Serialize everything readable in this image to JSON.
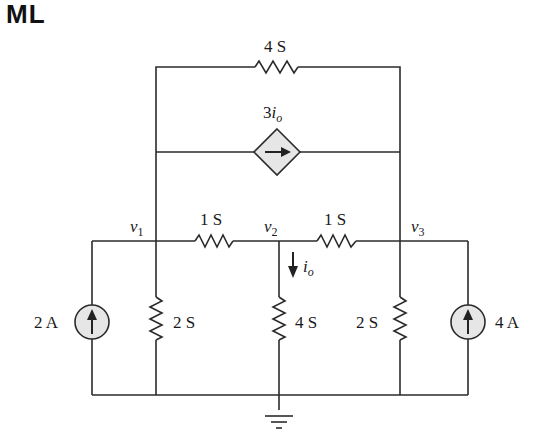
{
  "header": {
    "corner_text": "ML"
  },
  "circuit": {
    "top_resistor": {
      "value": "4 S"
    },
    "dependent_source": {
      "coef": "3",
      "var": "i",
      "sub": "o",
      "type": "current-controlled current source"
    },
    "nodes": [
      {
        "name": "v",
        "sub": "1"
      },
      {
        "name": "v",
        "sub": "2"
      },
      {
        "name": "v",
        "sub": "3"
      }
    ],
    "series_resistors": [
      {
        "value": "1 S"
      },
      {
        "value": "1 S"
      }
    ],
    "shunt_resistors": [
      {
        "value": "2 S"
      },
      {
        "value": "4 S"
      },
      {
        "value": "2 S"
      }
    ],
    "sources": [
      {
        "value": "2 A"
      },
      {
        "value": "4 A"
      }
    ],
    "current_label": {
      "var": "i",
      "sub": "o"
    },
    "colors": {
      "wire": "#2b2b2b",
      "source_fill": "#e6e6e6"
    }
  }
}
